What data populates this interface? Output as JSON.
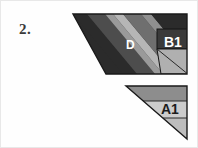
{
  "page": {
    "background_color": "#fefefe",
    "border_color": "#e8e8e8"
  },
  "problem": {
    "number_label": "2."
  },
  "figure": {
    "name": "striped-triangles-figure",
    "shapes": [
      {
        "id": "upper-triangle",
        "name": "upper-striped-triangle",
        "outline": "72,13 186,13 186,73 105,73",
        "outline_color": "#1a1a1a",
        "stripes": [
          {
            "id": "stripe-1",
            "fill": "#2b2b2b"
          },
          {
            "id": "stripe-2",
            "fill": "#4f4f4f"
          },
          {
            "id": "stripe-3",
            "fill": "#9a9a9a"
          },
          {
            "id": "stripe-4",
            "fill": "#b4b4b4"
          },
          {
            "id": "stripe-5",
            "fill": "#6e6e6e"
          },
          {
            "id": "stripe-6",
            "fill": "#8f8f8f"
          },
          {
            "id": "stripe-7",
            "fill": "#2b2b2b"
          }
        ]
      },
      {
        "id": "lower-triangle",
        "name": "lower-striped-triangle",
        "outline": "125,85 186,85 186,138",
        "outline_color": "#1a1a1a",
        "bands": [
          {
            "id": "band-top",
            "fill": "#8d8d8d"
          },
          {
            "id": "band-middle",
            "fill": "#c9c9c9"
          },
          {
            "id": "band-bottom",
            "fill": "#bfbfbf"
          }
        ]
      }
    ],
    "labels": [
      {
        "id": "D",
        "text": "D",
        "color": "#ffffff"
      },
      {
        "id": "B1",
        "text": "B1",
        "color": "#ffffff"
      },
      {
        "id": "A1",
        "text": "A1",
        "color": "#1d1d1d"
      }
    ],
    "boxes": [
      {
        "id": "b1-box",
        "name": "b1-callout-box",
        "fill": "#3a3a3a",
        "stroke": "#111111"
      },
      {
        "id": "a1-box",
        "name": "a1-callout-box",
        "fill": "#c9c9c9",
        "stroke": "#111111"
      }
    ]
  }
}
